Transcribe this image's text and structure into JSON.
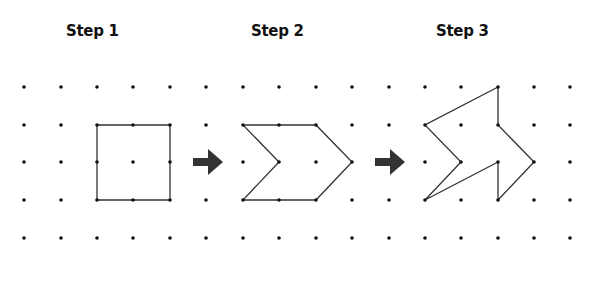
{
  "titles": [
    "Step 1",
    "Step 2",
    "Step 3"
  ],
  "grid": {
    "columns_x": [
      24,
      61,
      97,
      133,
      170,
      206,
      243,
      279,
      316,
      352,
      389,
      425,
      461,
      498,
      534,
      570
    ],
    "rows_y": [
      87,
      125,
      162,
      200,
      238
    ],
    "dot_color": "#111111"
  },
  "shapes": [
    {
      "name": "step-1-square",
      "points": [
        [
          97,
          125
        ],
        [
          133,
          125
        ],
        [
          170,
          125
        ],
        [
          170,
          162
        ],
        [
          170,
          200
        ],
        [
          133,
          200
        ],
        [
          97,
          200
        ],
        [
          97,
          162
        ]
      ]
    },
    {
      "name": "step-2-chevron",
      "points": [
        [
          243,
          125
        ],
        [
          279,
          125
        ],
        [
          316,
          125
        ],
        [
          352,
          162
        ],
        [
          316,
          200
        ],
        [
          279,
          200
        ],
        [
          243,
          200
        ],
        [
          279,
          162
        ]
      ]
    },
    {
      "name": "step-3-arrow-shape",
      "points": [
        [
          498,
          87
        ],
        [
          498,
          125
        ],
        [
          534,
          162
        ],
        [
          498,
          200
        ],
        [
          498,
          162
        ],
        [
          425,
          200
        ],
        [
          461,
          162
        ],
        [
          425,
          125
        ]
      ]
    }
  ],
  "arrows": [
    {
      "name": "arrow-step1-to-step2",
      "x": 193,
      "y": 162
    },
    {
      "name": "arrow-step2-to-step3",
      "x": 375,
      "y": 162
    }
  ],
  "colors": {
    "line": "#333333",
    "arrow": "#333333",
    "text": "#111111"
  }
}
